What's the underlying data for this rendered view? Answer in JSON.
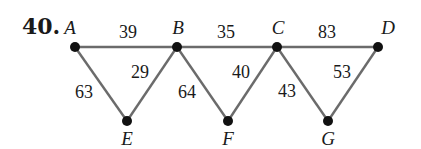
{
  "problem_number": "40.",
  "vertices": [
    {
      "id": "A",
      "label": "A",
      "x": 75,
      "y": 47,
      "lx": 70,
      "ly": 34
    },
    {
      "id": "B",
      "label": "B",
      "x": 177,
      "y": 47,
      "lx": 178,
      "ly": 34
    },
    {
      "id": "C",
      "label": "C",
      "x": 277,
      "y": 47,
      "lx": 278,
      "ly": 34
    },
    {
      "id": "D",
      "label": "D",
      "x": 378,
      "y": 47,
      "lx": 388,
      "ly": 34
    },
    {
      "id": "E",
      "label": "E",
      "x": 127,
      "y": 121,
      "lx": 127,
      "ly": 145
    },
    {
      "id": "F",
      "label": "F",
      "x": 228,
      "y": 121,
      "lx": 228,
      "ly": 145
    },
    {
      "id": "G",
      "label": "G",
      "x": 328,
      "y": 121,
      "lx": 328,
      "ly": 145
    }
  ],
  "edges": [
    {
      "from": "A",
      "to": "B",
      "weight": "39",
      "lx": 128,
      "ly": 38
    },
    {
      "from": "B",
      "to": "C",
      "weight": "35",
      "lx": 226,
      "ly": 38
    },
    {
      "from": "C",
      "to": "D",
      "weight": "83",
      "lx": 327,
      "ly": 38
    },
    {
      "from": "A",
      "to": "E",
      "weight": "63",
      "lx": 84,
      "ly": 98
    },
    {
      "from": "B",
      "to": "E",
      "weight": "29",
      "lx": 140,
      "ly": 78
    },
    {
      "from": "B",
      "to": "F",
      "weight": "64",
      "lx": 187,
      "ly": 98
    },
    {
      "from": "C",
      "to": "F",
      "weight": "40",
      "lx": 241,
      "ly": 78
    },
    {
      "from": "C",
      "to": "G",
      "weight": "43",
      "lx": 287,
      "ly": 97
    },
    {
      "from": "D",
      "to": "G",
      "weight": "53",
      "lx": 342,
      "ly": 78
    }
  ]
}
